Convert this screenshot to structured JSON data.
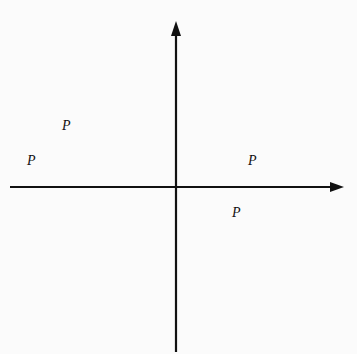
{
  "diagram": {
    "type": "coordinate-plane-polygon",
    "axes": {
      "x_label": "x",
      "y_label": "y"
    },
    "grid": {
      "x_min": -8,
      "x_max": 8,
      "y_min": -8,
      "y_max": 8,
      "step": 1
    },
    "points": [
      {
        "name": "P1",
        "sub": "1",
        "x": -4,
        "y": 3,
        "coord_text": "(−4, 3)"
      },
      {
        "name": "P2",
        "sub": "2",
        "x": 4,
        "y": 1,
        "coord_text": "(4, 1)"
      },
      {
        "name": "P3",
        "sub": "3",
        "x": 3,
        "y": -1,
        "coord_text": "(3, −1)"
      },
      {
        "name": "P4",
        "sub": "4",
        "x": -5,
        "y": 1,
        "coord_text": "(−5, 1)"
      }
    ],
    "polygon_order": [
      "P1",
      "P2",
      "P3",
      "P4"
    ],
    "colors": {
      "grid": "#9a9a9a",
      "ink": "#111111",
      "background": "#fbfbfb"
    }
  }
}
